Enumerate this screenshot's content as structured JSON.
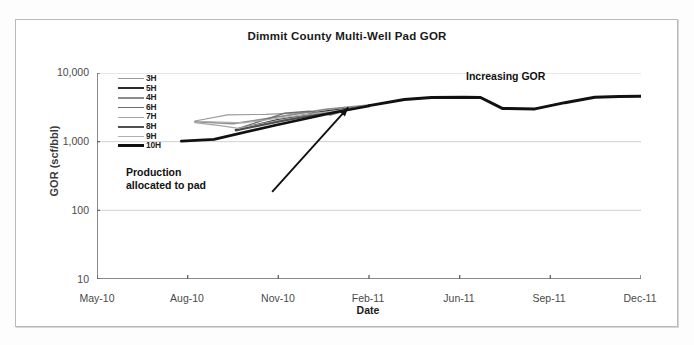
{
  "chart_data": {
    "type": "line",
    "title": "Dimmit County Multi-Well Pad GOR",
    "xlabel": "Date",
    "ylabel": "GOR (scf/bbl)",
    "yscale": "log",
    "ylim": [
      10,
      10000
    ],
    "ytick_labels": [
      "10,000",
      "1,000",
      "100",
      "10"
    ],
    "ytick_values": [
      10000,
      1000,
      100,
      10
    ],
    "xtick_labels": [
      "May-10",
      "Aug-10",
      "Nov-10",
      "Feb-11",
      "Jun-11",
      "Sep-11",
      "Dec-11"
    ],
    "xlim": [
      "May-10",
      "Dec-11"
    ],
    "grid": "horizontal",
    "legend_position": "upper-left-inside",
    "legend_entries": [
      "3H",
      "5H",
      "4H",
      "6H",
      "7H",
      "8H",
      "9H",
      "10H"
    ],
    "series": [
      {
        "name": "3H",
        "color": "#9a9a9a",
        "width": 1.2,
        "points": [
          [
            0.18,
            2000
          ],
          [
            0.24,
            2450
          ],
          [
            0.31,
            2500
          ],
          [
            0.4,
            2700
          ],
          [
            0.46,
            3050
          ],
          [
            0.5,
            3300
          ]
        ]
      },
      {
        "name": "5H",
        "color": "#2a2a2a",
        "width": 2.0,
        "points": [
          [
            0.255,
            1480
          ],
          [
            0.33,
            2050
          ],
          [
            0.42,
            2750
          ],
          [
            0.5,
            3350
          ]
        ]
      },
      {
        "name": "4H",
        "color": "#8d8d8d",
        "width": 1.6,
        "points": [
          [
            0.18,
            1950
          ],
          [
            0.25,
            1820
          ],
          [
            0.33,
            2280
          ],
          [
            0.42,
            2950
          ],
          [
            0.5,
            3400
          ]
        ]
      },
      {
        "name": "6H",
        "color": "#6e6e6e",
        "width": 1.4,
        "points": [
          [
            0.26,
            1560
          ],
          [
            0.345,
            2600
          ],
          [
            0.39,
            2780
          ],
          [
            0.43,
            2450
          ],
          [
            0.47,
            3000
          ],
          [
            0.5,
            3350
          ]
        ]
      },
      {
        "name": "7H",
        "color": "#a5a5a5",
        "width": 1.2,
        "points": [
          [
            0.18,
            1900
          ],
          [
            0.23,
            1700
          ],
          [
            0.26,
            1560
          ],
          [
            0.34,
            2100
          ],
          [
            0.43,
            2700
          ],
          [
            0.5,
            3300
          ]
        ]
      },
      {
        "name": "8H",
        "color": "#4f4f4f",
        "width": 1.8,
        "points": [
          [
            0.255,
            1450
          ],
          [
            0.34,
            2000
          ],
          [
            0.43,
            2700
          ],
          [
            0.5,
            3350
          ]
        ]
      },
      {
        "name": "9H",
        "color": "#b0b0b0",
        "width": 1.2,
        "points": [
          [
            0.185,
            1980
          ],
          [
            0.27,
            1880
          ],
          [
            0.37,
            2400
          ],
          [
            0.45,
            2900
          ],
          [
            0.5,
            3300
          ]
        ]
      },
      {
        "name": "10H",
        "color": "#111111",
        "width": 2.6,
        "points": [
          [
            0.155,
            1020
          ],
          [
            0.215,
            1080
          ],
          [
            0.33,
            1750
          ],
          [
            0.44,
            2700
          ],
          [
            0.5,
            3300
          ]
        ]
      }
    ],
    "trunk_series": {
      "name": "pad-allocated-total",
      "color": "#111111",
      "width": 3.0,
      "points": [
        [
          0.5,
          3350
        ],
        [
          0.565,
          4100
        ],
        [
          0.615,
          4400
        ],
        [
          0.675,
          4450
        ],
        [
          0.705,
          4400
        ],
        [
          0.745,
          3050
        ],
        [
          0.805,
          3000
        ],
        [
          0.86,
          3700
        ],
        [
          0.915,
          4450
        ],
        [
          0.96,
          4550
        ],
        [
          1.0,
          4600
        ]
      ]
    },
    "annotations": [
      {
        "name": "production-allocated-to-pad",
        "text": "Production\nallocated to pad",
        "line1": "Production",
        "line2": "allocated to pad",
        "arrow_from": [
          0.322,
          185
        ],
        "arrow_to": [
          0.462,
          3150
        ]
      },
      {
        "name": "increasing-gor",
        "text": "Increasing GOR"
      }
    ]
  },
  "labels": {
    "title": "Dimmit County Multi-Well Pad GOR",
    "y_axis": "GOR (scf/bbl)",
    "x_axis": "Date",
    "annotation_production_line1": "Production",
    "annotation_production_line2": "allocated to pad",
    "annotation_increasing": "Increasing GOR"
  }
}
